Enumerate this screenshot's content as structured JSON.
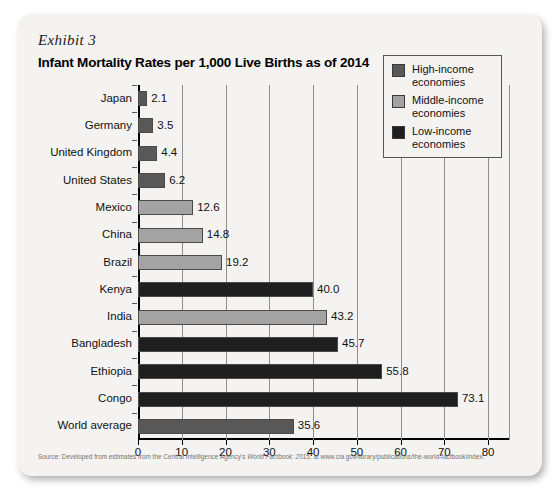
{
  "exhibit": {
    "label": "Exhibit 3",
    "title": "Infant Mortality Rates per 1,000 Live Births as of 2014"
  },
  "source": {
    "prefix": "Source: Developed from estimates from the Central Intelligence Agency's ",
    "italic": "World Factbook: 2015",
    "suffix": ", at www.cia.gov/library/publications/the-world-factbook/index."
  },
  "legend": {
    "items": [
      {
        "label_line1": "High-income",
        "label_line2": "economies",
        "color": "#585858"
      },
      {
        "label_line1": "Middle-income",
        "label_line2": "economies",
        "color": "#a3a3a3"
      },
      {
        "label_line1": "Low-income",
        "label_line2": "economies",
        "color": "#1f1f1f"
      }
    ]
  },
  "chart_data": {
    "type": "bar",
    "orientation": "horizontal",
    "title": "Infant Mortality Rates per 1,000 Live Births as of 2014",
    "xlabel": "",
    "ylabel": "",
    "xlim": [
      0,
      85
    ],
    "xticks": [
      0,
      10,
      20,
      30,
      40,
      50,
      60,
      70,
      80
    ],
    "grid": true,
    "legend_position": "upper-right",
    "categories": [
      "Japan",
      "Germany",
      "United Kingdom",
      "United States",
      "Mexico",
      "China",
      "Brazil",
      "Kenya",
      "India",
      "Bangladesh",
      "Ethiopia",
      "Congo",
      "World average"
    ],
    "values": [
      2.1,
      3.5,
      4.4,
      6.2,
      12.6,
      14.8,
      19.2,
      40.0,
      43.2,
      45.7,
      55.8,
      73.1,
      35.6
    ],
    "value_labels": [
      "2.1",
      "3.5",
      "4.4",
      "6.2",
      "12.6",
      "14.8",
      "19.2",
      "40.0",
      "43.2",
      "45.7",
      "55.8",
      "73.1",
      "35.6"
    ],
    "groups": [
      "high-income",
      "high-income",
      "high-income",
      "high-income",
      "middle-income",
      "middle-income",
      "middle-income",
      "low-income",
      "middle-income",
      "low-income",
      "low-income",
      "low-income",
      "world-average"
    ],
    "group_colors": {
      "high-income": "#585858",
      "middle-income": "#a3a3a3",
      "low-income": "#1f1f1f",
      "world-average": "#585858"
    }
  }
}
